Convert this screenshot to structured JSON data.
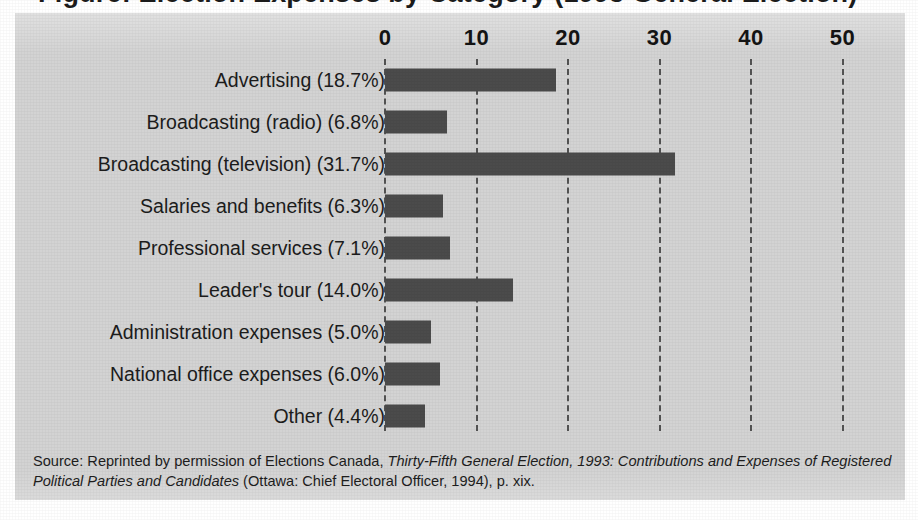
{
  "figure": {
    "title": "Figure: Election Expenses by Category (1993 General Election)",
    "panel_color": "#d3d3d3",
    "bar_color": "#4b4b4b",
    "gridline_color": "#535353"
  },
  "source": {
    "lead": "Source: Reprinted by permission of Elections Canada, ",
    "italic_title": "Thirty-Fifth General Election, 1993: Contributions and Expenses of Registered Political Parties and Candidates",
    "tail": " (Ottawa: Chief Electoral Officer, 1994), p. xix."
  },
  "chart_data": {
    "type": "bar",
    "orientation": "horizontal",
    "title": "Figure: Election Expenses by Category (1993 General Election)",
    "xlabel": "",
    "ylabel": "",
    "xlim": [
      0,
      55
    ],
    "xticks": [
      0,
      10,
      20,
      30,
      40,
      50
    ],
    "xtick_labels": [
      "0",
      "10",
      "20",
      "30",
      "40",
      "50"
    ],
    "grid": true,
    "grid_style": "dashed-vertical",
    "legend": false,
    "categories": [
      "Advertising (18.7%)",
      "Broadcasting (radio) (6.8%)",
      "Broadcasting (television) (31.7%)",
      "Salaries and benefits (6.3%)",
      "Professional services (7.1%)",
      "Leader's tour (14.0%)",
      "Administration expenses (5.0%)",
      "National office expenses (6.0%)",
      "Other (4.4%)"
    ],
    "values": [
      18.7,
      6.8,
      31.7,
      6.3,
      7.1,
      14.0,
      5.0,
      6.0,
      4.4
    ],
    "units": "percent"
  }
}
